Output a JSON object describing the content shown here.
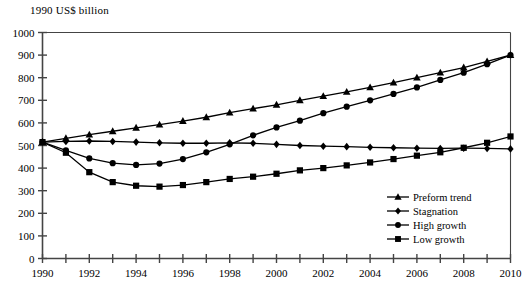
{
  "chart_data": {
    "type": "line",
    "title": "",
    "ylabel": "1990 US$ billion",
    "xlabel": "",
    "xlim": [
      1990,
      2010
    ],
    "ylim": [
      0,
      1000
    ],
    "ytick_step": 100,
    "yticks": [
      0,
      100,
      200,
      300,
      400,
      500,
      600,
      700,
      800,
      900,
      1000
    ],
    "ytick_labels": [
      "0",
      "100",
      "200",
      "300",
      "400",
      "500",
      "600",
      "700",
      "800",
      "900",
      "1000"
    ],
    "x": [
      1990,
      1991,
      1992,
      1993,
      1994,
      1995,
      1996,
      1997,
      1998,
      1999,
      2000,
      2001,
      2002,
      2003,
      2004,
      2005,
      2006,
      2007,
      2008,
      2009,
      2010
    ],
    "xticks": [
      1990,
      1991,
      1992,
      1993,
      1994,
      1995,
      1996,
      1997,
      1998,
      1999,
      2000,
      2001,
      2002,
      2003,
      2004,
      2005,
      2006,
      2007,
      2008,
      2009,
      2010
    ],
    "xtick_labels": [
      "1990",
      "",
      "1992",
      "",
      "1994",
      "",
      "1996",
      "",
      "1998",
      "",
      "2000",
      "",
      "2002",
      "",
      "2004",
      "",
      "2006",
      "",
      "2008",
      "",
      "2010"
    ],
    "grid": false,
    "legend_position": "lower-right",
    "series": [
      {
        "name": "Preform trend",
        "marker": "triangle",
        "values": [
          515,
          532,
          548,
          563,
          578,
          592,
          608,
          625,
          645,
          663,
          680,
          700,
          718,
          737,
          757,
          778,
          800,
          822,
          845,
          872,
          900
        ]
      },
      {
        "name": "Stagnation",
        "marker": "diamond",
        "values": [
          515,
          518,
          520,
          518,
          515,
          512,
          510,
          510,
          512,
          510,
          505,
          500,
          497,
          495,
          492,
          490,
          488,
          487,
          488,
          487,
          485
        ]
      },
      {
        "name": "High growth",
        "marker": "circle",
        "values": [
          515,
          478,
          443,
          422,
          414,
          420,
          440,
          470,
          505,
          545,
          580,
          610,
          643,
          672,
          700,
          728,
          757,
          790,
          822,
          860,
          900
        ]
      },
      {
        "name": "Low growth",
        "marker": "square",
        "values": [
          515,
          468,
          382,
          338,
          322,
          318,
          325,
          338,
          352,
          362,
          375,
          390,
          400,
          412,
          425,
          440,
          455,
          470,
          490,
          512,
          540
        ]
      }
    ]
  },
  "legend": {
    "items": [
      {
        "label": "Preform trend",
        "marker": "triangle"
      },
      {
        "label": "Stagnation",
        "marker": "diamond"
      },
      {
        "label": "High growth",
        "marker": "circle"
      },
      {
        "label": "Low growth",
        "marker": "square"
      }
    ]
  },
  "colors": {
    "line": "#000000",
    "axis": "#444444",
    "background": "#ffffff"
  }
}
